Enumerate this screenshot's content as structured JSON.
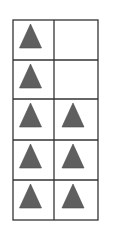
{
  "diagram": {
    "type": "tally-grid",
    "columns": 2,
    "rows": 5,
    "shape": "triangle",
    "shape_color": "#5f5f5f",
    "line_color": "#333333",
    "cells": [
      [
        true,
        false
      ],
      [
        true,
        false
      ],
      [
        true,
        true
      ],
      [
        true,
        true
      ],
      [
        true,
        true
      ]
    ],
    "counts": {
      "column_1": 5,
      "column_2": 3,
      "total": 8
    }
  }
}
